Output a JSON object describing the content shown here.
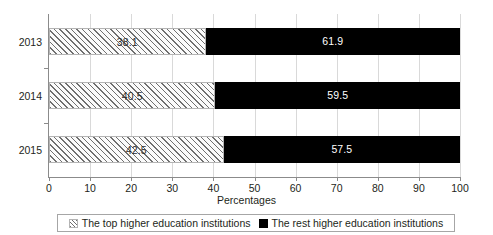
{
  "chart_data": {
    "type": "bar",
    "orientation": "horizontal",
    "stacked": true,
    "stacked_percent": true,
    "title": "",
    "xlabel": "Percentages",
    "ylabel": "",
    "categories": [
      "2013",
      "2014",
      "2015"
    ],
    "xlim": [
      0,
      100
    ],
    "xticks": [
      0,
      10,
      20,
      30,
      40,
      50,
      60,
      70,
      80,
      90,
      100
    ],
    "xtick_labels": [
      "0",
      "10",
      "20",
      "30",
      "40",
      "50",
      "60",
      "70",
      "80",
      "90",
      "100"
    ],
    "grid": "vertical",
    "legend_position": "bottom",
    "series": [
      {
        "name": "The top higher education institutions",
        "fill": "hatch-diagonal",
        "color": "#6f6f6f",
        "values": [
          38.1,
          40.5,
          42.5
        ],
        "labels": [
          "38.1",
          "40.5",
          "42.5"
        ]
      },
      {
        "name": "The rest higher education institutions",
        "fill": "solid",
        "color": "#000000",
        "values": [
          61.9,
          59.5,
          57.5
        ],
        "labels": [
          "61.9",
          "59.5",
          "57.5"
        ]
      }
    ]
  },
  "axis": {
    "x_title": "Percentages"
  },
  "legend": {
    "items": [
      {
        "label": "The top higher education institutions",
        "swatch": "hatch-swatch-icon"
      },
      {
        "label": "The rest higher education institutions",
        "swatch": "solid-swatch-icon"
      }
    ]
  }
}
